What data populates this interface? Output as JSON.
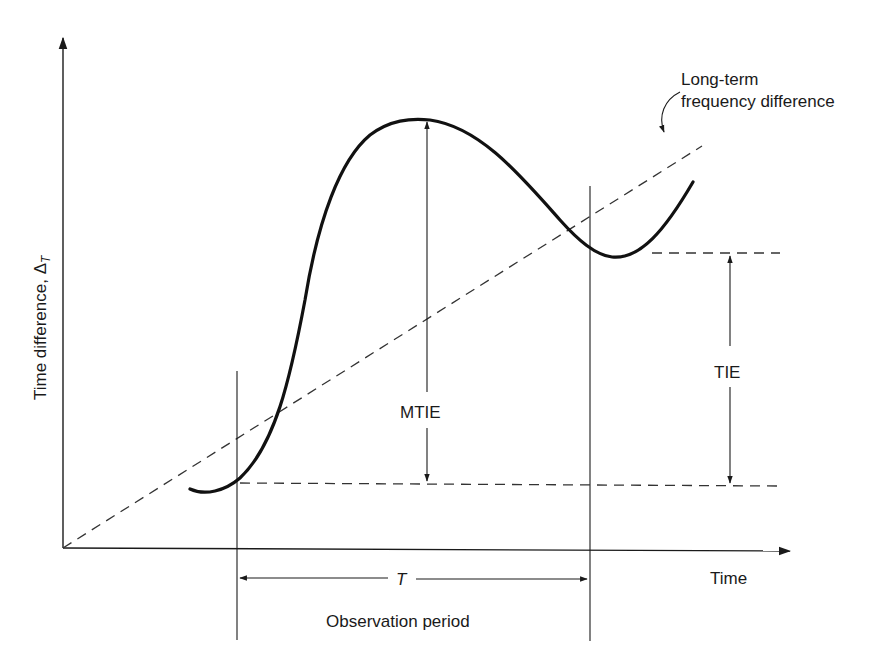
{
  "diagram": {
    "title": "",
    "y_axis_label": "Time difference, Δ",
    "y_axis_subscript": "T",
    "x_axis_label": "Time",
    "annotations": {
      "long_term_line1": "Long-term",
      "long_term_line2": "frequency difference",
      "mtie": "MTIE",
      "tie": "TIE",
      "period_symbol": "T",
      "period_label": "Observation period"
    },
    "elements": [
      "time-difference curve (solid)",
      "long-term frequency difference line (dashed)",
      "observation period boundaries (vertical lines)",
      "MTIE span arrow",
      "TIE span arrow",
      "observation period T arrow"
    ],
    "colors": {
      "stroke": "#1a1a1a",
      "dashed": "#333333",
      "background": "#ffffff"
    }
  }
}
